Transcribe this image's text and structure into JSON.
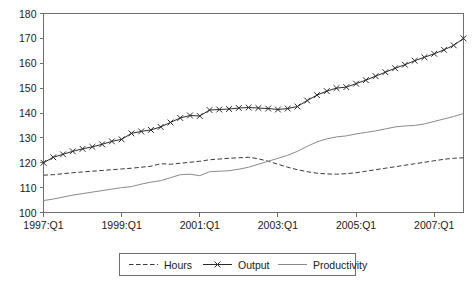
{
  "chart_data": {
    "type": "line",
    "title": "",
    "subtitle": "",
    "xlabel": "",
    "ylabel": "",
    "ylim": [
      100,
      180
    ],
    "ytick_values": [
      100,
      110,
      120,
      130,
      140,
      150,
      160,
      170,
      180
    ],
    "ytick_labels": [
      "100",
      "110",
      "120",
      "130",
      "140",
      "150",
      "160",
      "170",
      "180"
    ],
    "xtick_labels": [
      "1997:Q1",
      "1999:Q1",
      "2001:Q1",
      "2003:Q1",
      "2005:Q1",
      "2007:Q1"
    ],
    "xtick_indices": [
      0,
      8,
      16,
      24,
      32,
      40
    ],
    "x": [
      "1997:Q1",
      "1997:Q2",
      "1997:Q3",
      "1997:Q4",
      "1998:Q1",
      "1998:Q2",
      "1998:Q3",
      "1998:Q4",
      "1999:Q1",
      "1999:Q2",
      "1999:Q3",
      "1999:Q4",
      "2000:Q1",
      "2000:Q2",
      "2000:Q3",
      "2000:Q4",
      "2001:Q1",
      "2001:Q2",
      "2001:Q3",
      "2001:Q4",
      "2002:Q1",
      "2002:Q2",
      "2002:Q3",
      "2002:Q4",
      "2003:Q1",
      "2003:Q2",
      "2003:Q3",
      "2003:Q4",
      "2004:Q1",
      "2004:Q2",
      "2004:Q3",
      "2004:Q4",
      "2005:Q1",
      "2005:Q2",
      "2005:Q3",
      "2005:Q4",
      "2006:Q1",
      "2006:Q2",
      "2006:Q3",
      "2006:Q4",
      "2007:Q1",
      "2007:Q2",
      "2007:Q3",
      "2007:Q4"
    ],
    "grid": false,
    "legend_position": "bottom",
    "series": [
      {
        "name": "Hours",
        "style": "dashed",
        "marker": "none",
        "color": "#3a3a3a",
        "values": [
          115.0,
          115.2,
          115.6,
          116.0,
          116.3,
          116.6,
          116.9,
          117.2,
          117.5,
          117.8,
          118.2,
          118.6,
          119.6,
          119.4,
          119.8,
          120.2,
          120.6,
          121.2,
          121.5,
          121.8,
          122.0,
          122.2,
          121.6,
          120.6,
          119.4,
          118.2,
          117.2,
          116.4,
          115.8,
          115.5,
          115.4,
          115.6,
          116.0,
          116.6,
          117.2,
          117.8,
          118.4,
          119.0,
          119.6,
          120.2,
          120.8,
          121.4,
          121.8,
          122.0
        ]
      },
      {
        "name": "Output",
        "style": "solid",
        "marker": "x",
        "color": "#2b2b2b",
        "values": [
          120.0,
          122.2,
          123.4,
          124.6,
          125.6,
          126.4,
          127.4,
          128.6,
          129.4,
          131.8,
          132.6,
          133.2,
          134.4,
          136.2,
          138.0,
          139.0,
          138.8,
          141.2,
          141.4,
          141.6,
          142.0,
          142.2,
          142.0,
          141.8,
          141.4,
          141.8,
          142.6,
          145.0,
          147.2,
          148.8,
          150.0,
          150.4,
          151.8,
          153.2,
          154.8,
          156.4,
          158.0,
          159.4,
          161.0,
          162.4,
          163.8,
          165.4,
          167.2,
          170.0
        ]
      },
      {
        "name": "Productivity",
        "style": "solid",
        "marker": "none",
        "color": "#8a8a8a",
        "values": [
          104.8,
          105.4,
          106.2,
          107.0,
          107.6,
          108.2,
          108.8,
          109.4,
          110.0,
          110.4,
          111.4,
          112.2,
          112.8,
          114.0,
          115.2,
          115.4,
          114.8,
          116.4,
          116.6,
          116.8,
          117.4,
          118.2,
          119.4,
          120.6,
          121.8,
          123.0,
          124.6,
          126.6,
          128.4,
          129.6,
          130.4,
          130.8,
          131.6,
          132.2,
          132.8,
          133.6,
          134.4,
          134.8,
          135.0,
          135.6,
          136.6,
          137.6,
          138.6,
          139.8
        ]
      }
    ]
  },
  "legend": {
    "items": [
      {
        "label": "Hours",
        "style": "dashed",
        "marker": "none"
      },
      {
        "label": "Output",
        "style": "solid",
        "marker": "x"
      },
      {
        "label": "Productivity",
        "style": "solid",
        "marker": "none"
      }
    ]
  }
}
